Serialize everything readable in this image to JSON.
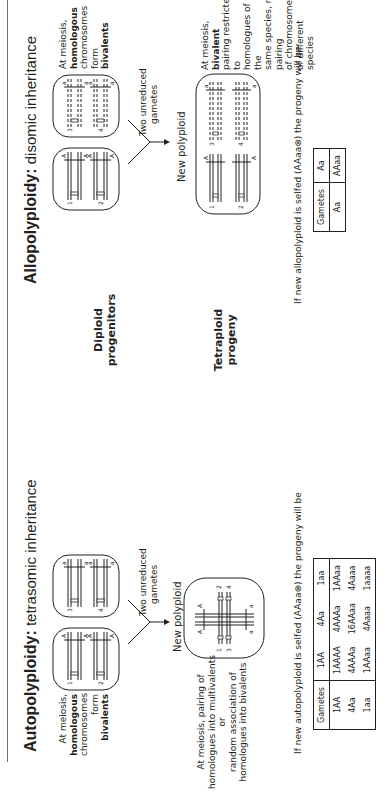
{
  "autopolyploidy": {
    "title_bold": "Autopolyploidy:",
    "title_rest": "tetrasomic inheritance",
    "parent_note": [
      "At meiosis,",
      "homologous",
      "chromosomes",
      "form bivalents"
    ],
    "parent_note_bold": {
      "homologous": true,
      "bivalents": true
    },
    "parents": [
      {
        "chromosomes": [
          "1",
          "2"
        ],
        "allele": "A"
      },
      {
        "chromosomes": [
          "3",
          "4"
        ],
        "allele": "a"
      }
    ],
    "gametes_label": [
      "Two unreduced",
      "gametes"
    ],
    "new_polyploid_label": "New polyploid",
    "offspring_chromosomes": [
      "1",
      "2",
      "3",
      "4"
    ],
    "offspring_alleles": {
      "top": [
        "A",
        "A"
      ],
      "bottom": [
        "a",
        "a"
      ]
    },
    "offspring_note": [
      "At meiosis, pairing of",
      "homologues into multivalents or",
      "random association of",
      "homologues into bivalents"
    ],
    "selfing_caption": "If new autopolyploid is selfed (AAaa⊗) the progeny will be",
    "table": {
      "header": [
        "Gametes",
        "1AA",
        "4Aa",
        "1aa"
      ],
      "rows": [
        [
          "1AA",
          "1AAAA",
          "4AAAa",
          "1AAaa"
        ],
        [
          "4Aa",
          "4AAAa",
          "16AAaa",
          "4Aaaa"
        ],
        [
          "1aa",
          "1AAaa",
          "4Aaaa",
          "1aaaa"
        ]
      ]
    }
  },
  "row_labels": {
    "diploid": [
      "Diploid",
      "progenitors"
    ],
    "tetraploid": [
      "Tetraploid",
      "progeny"
    ]
  },
  "allopolyploidy": {
    "title_bold": "Allopolyploidy:",
    "title_rest": "disomic inheritance",
    "parent_note": [
      "At meiosis,",
      "homologous",
      "chromosomes",
      "form bivalents"
    ],
    "parents": [
      {
        "chromosomes": [
          "1",
          "2"
        ],
        "allele": "A"
      },
      {
        "chromosomes": [
          "3",
          "4"
        ],
        "allele": "a"
      }
    ],
    "gametes_label": [
      "Two unreduced",
      "gametes"
    ],
    "new_polyploid_label": "New polyploid",
    "offspring_chromosomes": [
      "1",
      "2",
      "3",
      "4"
    ],
    "offspring_alleles": {
      "left": [
        "A",
        "A"
      ],
      "right": [
        "a",
        "a"
      ]
    },
    "offspring_note": [
      "At meiosis, bivalent",
      "pairing restricted to",
      "homologues of the",
      "same species, no pairing",
      "of chromosomes",
      "of different species"
    ],
    "selfing_caption": "If new allopolyploid is selfed (AAaa⊗) the progeny will be",
    "table": {
      "header": [
        "Gametes",
        "Aa"
      ],
      "rows": [
        [
          "Aa",
          "AAaa"
        ]
      ]
    }
  }
}
